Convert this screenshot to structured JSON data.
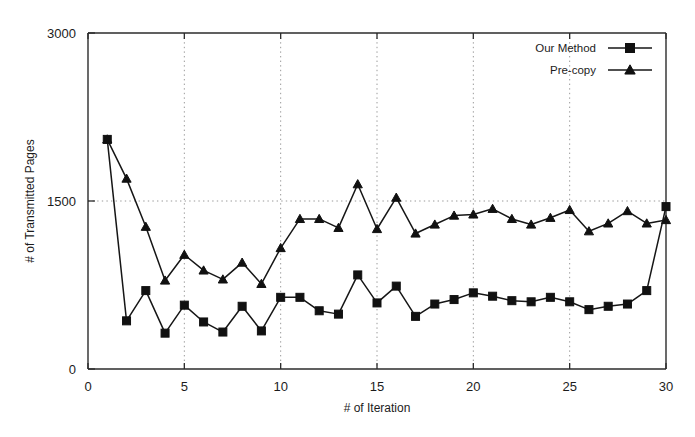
{
  "chart_data": {
    "type": "line",
    "title": "",
    "xlabel": "# of Iteration",
    "ylabel": "# of Transmitted Pages",
    "xlim": [
      0,
      30
    ],
    "ylim": [
      0,
      3000
    ],
    "xticks": [
      0,
      5,
      10,
      15,
      20,
      25,
      30
    ],
    "yticks": [
      0,
      1500,
      3000
    ],
    "xtick_labels": [
      "0",
      "5",
      "10",
      "15",
      "20",
      "25",
      "30"
    ],
    "ytick_labels": [
      "0",
      "1500",
      "3000"
    ],
    "grid": "dotted gridlines at x = 5,10,15,20,25 and y = 1500",
    "legend_position": "top-right inside axes",
    "x": [
      1,
      2,
      3,
      4,
      5,
      6,
      7,
      8,
      9,
      10,
      11,
      12,
      13,
      14,
      15,
      16,
      17,
      18,
      19,
      20,
      21,
      22,
      23,
      24,
      25,
      26,
      27,
      28,
      29,
      30
    ],
    "series": [
      {
        "name": "Our Method",
        "marker": "square",
        "values": [
          2050,
          430,
          700,
          320,
          570,
          420,
          330,
          560,
          340,
          640,
          640,
          520,
          490,
          840,
          590,
          740,
          470,
          580,
          620,
          680,
          650,
          610,
          600,
          640,
          600,
          530,
          560,
          580,
          700,
          1450
        ]
      },
      {
        "name": "Pre-copy",
        "marker": "triangle",
        "values": [
          2050,
          1700,
          1270,
          790,
          1020,
          880,
          800,
          950,
          760,
          1080,
          1340,
          1340,
          1260,
          1650,
          1250,
          1530,
          1210,
          1290,
          1370,
          1380,
          1430,
          1340,
          1290,
          1350,
          1420,
          1230,
          1300,
          1410,
          1300,
          1330
        ]
      }
    ]
  },
  "legend": {
    "items": [
      {
        "label": "Our Method",
        "marker": "square"
      },
      {
        "label": "Pre-copy",
        "marker": "triangle"
      }
    ]
  },
  "axes": {
    "x_title": "# of Iteration",
    "y_title": "# of Transmitted Pages"
  }
}
